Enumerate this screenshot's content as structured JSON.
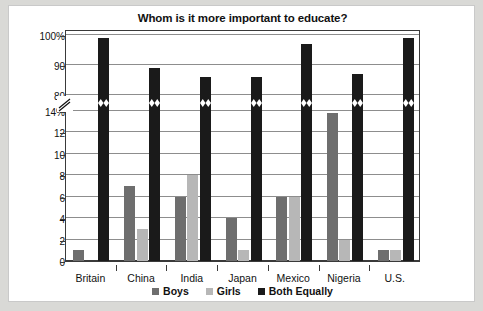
{
  "chart_data": {
    "type": "bar",
    "title": "Whom is it more important to educate?",
    "xlabel": "",
    "ylabel": "",
    "grid": true,
    "legend_position": "bottom",
    "axis_note": "broken y-axis between 14% and 80%",
    "categories": [
      "Britain",
      "China",
      "India",
      "Japan",
      "Mexico",
      "Nigeria",
      "U.S."
    ],
    "ytick_labels": [
      "100%",
      "90",
      "80",
      "14%",
      "12",
      "10",
      "8",
      "6",
      "4",
      "2",
      "0"
    ],
    "ylim_lower": [
      0,
      14
    ],
    "ylim_upper": [
      80,
      100
    ],
    "series": [
      {
        "name": "Boys",
        "color": "#6e6e6e",
        "values": [
          1,
          7,
          6,
          4,
          6,
          13.8,
          1
        ]
      },
      {
        "name": "Girls",
        "color": "#b7b7b7",
        "values": [
          0,
          3,
          8,
          1,
          6,
          2,
          1
        ]
      },
      {
        "name": "Both Equally",
        "color": "#1a1a1a",
        "values": [
          99,
          89,
          86,
          86,
          97,
          87,
          99
        ]
      }
    ]
  },
  "legend": {
    "items": [
      {
        "label": "Boys"
      },
      {
        "label": "Girls"
      },
      {
        "label": "Both Equally"
      }
    ]
  }
}
